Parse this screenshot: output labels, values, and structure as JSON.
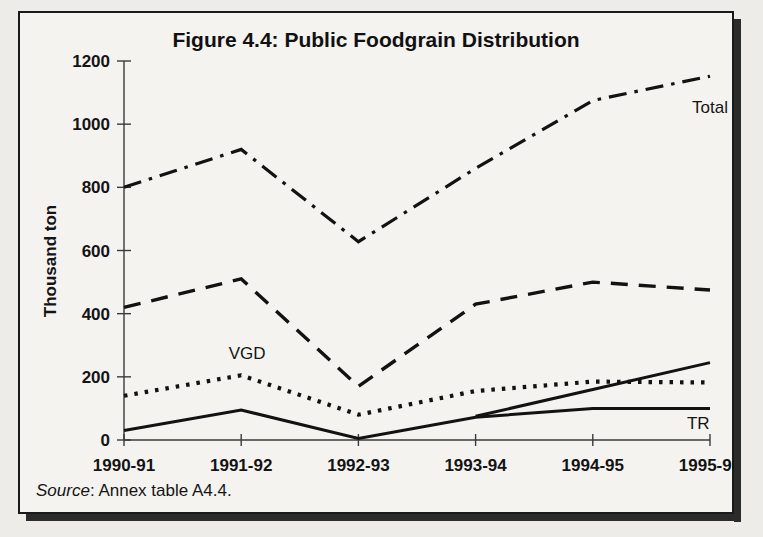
{
  "figure": {
    "title": "Figure 4.4: Public Foodgrain Distribution",
    "source_word": "Source",
    "source_rest": ": Annex table A4.4."
  },
  "chart_data": {
    "type": "line",
    "title": "Figure 4.4: Public Foodgrain Distribution",
    "xlabel": "",
    "ylabel": "Thousand ton",
    "categories": [
      "1990-91",
      "1991-92",
      "1992-93",
      "1993-94",
      "1994-95",
      "1995-96"
    ],
    "ylim": [
      0,
      1200
    ],
    "yticks": [
      0,
      200,
      400,
      600,
      800,
      1000,
      1200
    ],
    "ytick_labels": [
      "0",
      "200",
      "400",
      "600",
      "800",
      "1000",
      "1200"
    ],
    "grid": false,
    "legend": "inline-labels",
    "series": [
      {
        "name": "Total",
        "style": "dash-dot",
        "label": "Total",
        "label_x": 1995.0,
        "label_y": 1035,
        "values": [
          800,
          920,
          628,
          860,
          1075,
          1152
        ]
      },
      {
        "name": "FFW",
        "style": "dashed",
        "label": "FFW",
        "label_x": 1995.75,
        "label_y": 545,
        "values": [
          420,
          510,
          170,
          430,
          500,
          475
        ]
      },
      {
        "name": "VGD",
        "style": "dotted",
        "label": "VGD",
        "label_x": 1991.05,
        "label_y": 255,
        "values": [
          140,
          205,
          80,
          155,
          185,
          182
        ]
      },
      {
        "name": "FFE",
        "style": "solid",
        "label": "FFE",
        "label_x": 1995.7,
        "label_y": 300,
        "values": [
          null,
          null,
          null,
          75,
          160,
          245
        ]
      },
      {
        "name": "TR",
        "style": "solid",
        "label": "TR",
        "label_x": 1994.9,
        "label_y": 35,
        "values": [
          30,
          95,
          5,
          72,
          100,
          100
        ]
      }
    ]
  }
}
